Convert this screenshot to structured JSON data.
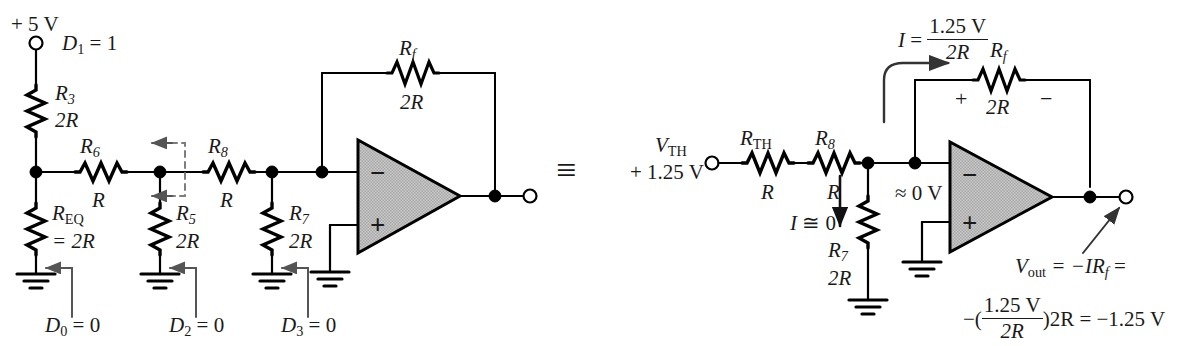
{
  "figure": {
    "equivalence_symbol": "≡",
    "stroke_color": "#000000",
    "opamp_fill": "#b3b3b3",
    "label_color": "#1a1a1a"
  },
  "left_circuit": {
    "supply_label": "+ 5 V",
    "d1_label_d": "D",
    "d1_label_sub": "1",
    "d1_label_val": " = 1",
    "r3": {
      "name": "R",
      "sub": "3",
      "value": "2R"
    },
    "r6": {
      "name": "R",
      "sub": "6",
      "value": "R"
    },
    "r8": {
      "name": "R",
      "sub": "8",
      "value": "R"
    },
    "req": {
      "name": "R",
      "sub": "EQ",
      "value": "= 2R"
    },
    "r5": {
      "name": "R",
      "sub": "5",
      "value": "2R"
    },
    "r7": {
      "name": "R",
      "sub": "7",
      "value": "2R"
    },
    "rf": {
      "name": "R",
      "sub": "f",
      "value": "2R"
    },
    "opamp_minus": "−",
    "opamp_plus": "+",
    "d0_label_d": "D",
    "d0_label_sub": "0",
    "d0_label_val": " = 0",
    "d2_label_d": "D",
    "d2_label_sub": "2",
    "d2_label_val": " = 0",
    "d3_label_d": "D",
    "d3_label_sub": "3",
    "d3_label_val": " = 0"
  },
  "right_circuit": {
    "vth_name": "V",
    "vth_sub": "TH",
    "vth_value": "+ 1.25 V",
    "rth": {
      "name": "R",
      "sub": "TH",
      "value": "R"
    },
    "r8": {
      "name": "R",
      "sub": "8",
      "value": "R"
    },
    "r7": {
      "name": "R",
      "sub": "7",
      "value": "2R"
    },
    "rf": {
      "name": "R",
      "sub": "f",
      "value": "2R"
    },
    "current_eq_I": "I",
    "current_eq_equals": " = ",
    "current_eq_num": "1.25 V",
    "current_eq_den": "2R",
    "i_approx_zero_I": "I",
    "i_approx_zero_rest": " ≅ 0",
    "virtual_ground": "≈ 0 V",
    "rf_plus": "+",
    "rf_minus": "−",
    "opamp_minus": "−",
    "opamp_plus": "+",
    "vout_name": "V",
    "vout_sub": "out",
    "vout_expr": " =  −IR",
    "vout_expr_sub": "f",
    "vout_expr_tail": " =",
    "vout_line2_lead": "−(",
    "vout_line2_num": "1.25 V",
    "vout_line2_den": "2R",
    "vout_line2_tail": ")2R = −1.25 V"
  }
}
